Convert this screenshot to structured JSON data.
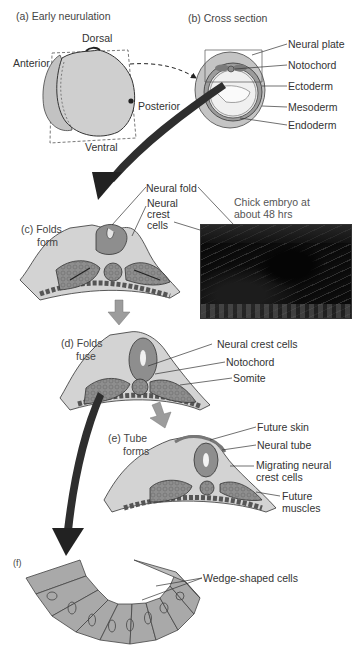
{
  "figure": {
    "panels": {
      "a": {
        "title": "(a) Early neurulation",
        "labels": {
          "dorsal": "Dorsal",
          "anterior": "Anterior",
          "posterior": "Posterior",
          "ventral": "Ventral"
        }
      },
      "b": {
        "title": "(b) Cross section",
        "labels": [
          "Neural plate",
          "Notochord",
          "Ectoderm",
          "Mesoderm",
          "Endoderm"
        ]
      },
      "c": {
        "title_line1": "(c) Folds",
        "title_line2": "form",
        "labels": {
          "neural_fold": "Neural fold",
          "neural_crest_1": "Neural",
          "neural_crest_2": "crest",
          "neural_crest_3": "cells"
        },
        "photo_caption_line1": "Chick embryo at",
        "photo_caption_line2": "about 48 hrs"
      },
      "d": {
        "title_line1": "(d) Folds",
        "title_line2": "fuse",
        "labels": [
          "Neural crest cells",
          "Notochord",
          "Somite"
        ]
      },
      "e": {
        "title_line1": "(e) Tube",
        "title_line2": "forms",
        "labels": {
          "future_skin": "Future skin",
          "neural_tube": "Neural tube",
          "migrating_1": "Migrating neural",
          "migrating_2": "crest cells",
          "muscles_1": "Future",
          "muscles_2": "muscles"
        }
      },
      "f": {
        "title": "(f)",
        "labels": {
          "wedge": "Wedge-shaped cells"
        }
      }
    },
    "colors": {
      "tissue_light": "#d4d4d4",
      "tissue_mid": "#a8a8a8",
      "tissue_dark": "#7c7c7c",
      "outline": "#3a3a3a",
      "arrow_dark": "#2b2b2b",
      "arrow_light": "#9a9a9a"
    }
  }
}
